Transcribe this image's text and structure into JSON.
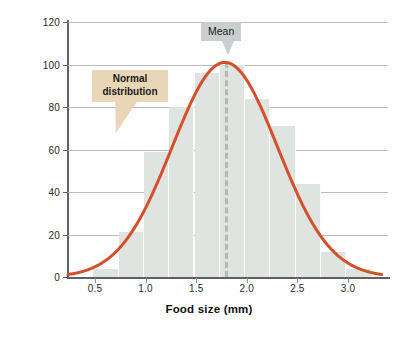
{
  "chart_data": {
    "type": "bar",
    "title": "",
    "subtitle": "",
    "xlabel": "Food size (mm)",
    "ylabel": "Frequency",
    "xlim": [
      0.25,
      3.35
    ],
    "ylim": [
      0,
      120
    ],
    "grid": true,
    "legend": "none",
    "x_ticks": [
      "0.5",
      "1.0",
      "1.5",
      "2.0",
      "2.5",
      "3.0"
    ],
    "x_tick_values": [
      0.5,
      1.0,
      1.5,
      2.0,
      2.5,
      3.0
    ],
    "y_ticks": [
      "0",
      "20",
      "40",
      "60",
      "80",
      "100",
      "120"
    ],
    "y_tick_values": [
      0,
      20,
      40,
      60,
      80,
      100,
      120
    ],
    "bin_width": 0.25,
    "bins": [
      {
        "start": 0.5,
        "end": 0.75,
        "center": 0.625,
        "value": 4
      },
      {
        "start": 0.75,
        "end": 1.0,
        "center": 0.875,
        "value": 21
      },
      {
        "start": 1.0,
        "end": 1.25,
        "center": 1.125,
        "value": 59
      },
      {
        "start": 1.25,
        "end": 1.5,
        "center": 1.375,
        "value": 80
      },
      {
        "start": 1.5,
        "end": 1.75,
        "center": 1.625,
        "value": 96
      },
      {
        "start": 1.75,
        "end": 2.0,
        "center": 1.875,
        "value": 100
      },
      {
        "start": 2.0,
        "end": 2.25,
        "center": 2.125,
        "value": 84
      },
      {
        "start": 2.25,
        "end": 2.5,
        "center": 2.375,
        "value": 71
      },
      {
        "start": 2.5,
        "end": 2.75,
        "center": 2.625,
        "value": 44
      },
      {
        "start": 2.75,
        "end": 3.0,
        "center": 2.875,
        "value": 12
      },
      {
        "start": 3.0,
        "end": 3.25,
        "center": 3.125,
        "value": 4
      }
    ],
    "categories": [
      "0.50-0.75",
      "0.75-1.00",
      "1.00-1.25",
      "1.25-1.50",
      "1.50-1.75",
      "1.75-2.00",
      "2.00-2.25",
      "2.25-2.50",
      "2.50-2.75",
      "2.75-3.00",
      "3.00-3.25"
    ],
    "values": [
      4,
      21,
      59,
      80,
      96,
      100,
      84,
      71,
      44,
      12,
      4
    ],
    "overlay_curve": {
      "name": "Normal distribution",
      "mean": 1.8,
      "sd": 0.52,
      "peak": 101,
      "color": "#d4502a"
    },
    "annotations": [
      {
        "id": "mean",
        "label": "Mean",
        "x": 1.8,
        "style": "gray-box-with-pointer"
      },
      {
        "id": "normal",
        "label": "Normal distribution",
        "style": "tan-box-with-pointer"
      }
    ]
  },
  "annotations": {
    "mean_label": "Mean",
    "normal_label_line1": "Normal",
    "normal_label_line2": "distribution"
  },
  "colors": {
    "bar_fill": "#dfe4e0",
    "curve": "#d4502a",
    "mean_box": "#c9cfcf",
    "mean_line": "#b3bab6",
    "normal_box": "#e9d6b7",
    "axis": "#5d6163",
    "grid": "#b9bcbd",
    "background": "#fefefe"
  }
}
